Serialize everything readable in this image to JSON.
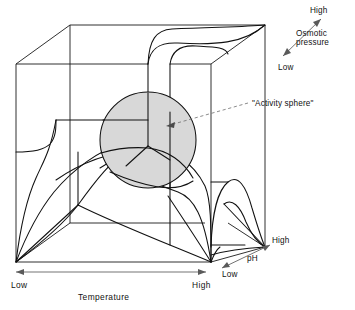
{
  "figure": {
    "background_color": "#ffffff",
    "line_color": "#111111",
    "sphere_fill_color": "#d8d8d8",
    "axis_arrow_color": "#5a5a5a",
    "leader_color": "#6e6e6e"
  },
  "callout": {
    "label": "\"Activity sphere\"",
    "leader_from": [
      248,
      103
    ],
    "leader_to": [
      166,
      126
    ]
  },
  "axes": [
    {
      "id": "temperature",
      "name": "Temperature",
      "label": "Temperature",
      "low_label": "Low",
      "high_label": "High",
      "orientation": "horizontal",
      "direction": "left-to-right",
      "low_end": [
        16,
        272
      ],
      "high_end": [
        206,
        272
      ]
    },
    {
      "id": "ph",
      "name": "pH",
      "label": "pH",
      "low_label": "Low",
      "high_label": "High",
      "orientation": "diagonal",
      "direction": "lower-left-to-upper-right",
      "low_end": [
        222,
        268
      ],
      "high_end": [
        270,
        245
      ]
    },
    {
      "id": "osmotic-pressure",
      "name": "Osmotic pressure",
      "label_line1": "Osmotic",
      "label_line2": "pressure",
      "low_label": "Low",
      "high_label": "High",
      "orientation": "diagonal",
      "direction": "lower-left-to-upper-right",
      "low_end": [
        283,
        56
      ],
      "high_end": [
        321,
        19
      ]
    }
  ],
  "cube": {
    "front_top_left": [
      16,
      64
    ],
    "front_top_right": [
      211,
      64
    ],
    "front_bottom_left": [
      16,
      262
    ],
    "front_bottom_right": [
      211,
      262
    ],
    "back_top_left": [
      70,
      25
    ],
    "back_top_right": [
      265,
      25
    ],
    "back_bottom_left": [
      70,
      223
    ],
    "back_bottom_right": [
      265,
      247
    ]
  },
  "sphere": {
    "label": "Activity sphere",
    "center": [
      148,
      140
    ],
    "radius": 48
  }
}
